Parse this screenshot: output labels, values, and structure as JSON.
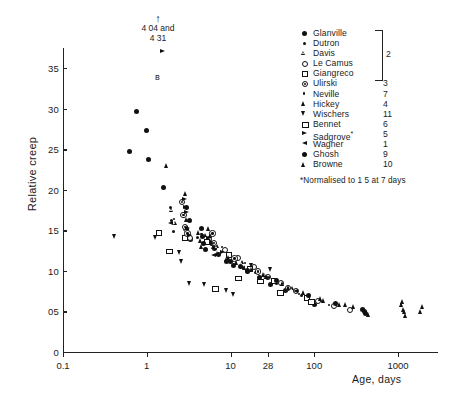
{
  "chart_data": {
    "type": "scatter",
    "title": "",
    "xlabel": "Age, days",
    "ylabel": "Relative creep",
    "xscale": "log",
    "xlim": [
      0.1,
      3000
    ],
    "ylim": [
      0,
      3.75
    ],
    "grid": false,
    "legend_position": "top-right",
    "xticks": [
      "0.1",
      "1",
      "10",
      "28",
      "100",
      "1000"
    ],
    "xtick_values": [
      0.1,
      1,
      10,
      28,
      100,
      1000
    ],
    "yticks": [
      "0",
      "05",
      "10",
      "15",
      "20",
      "25",
      "30",
      "35"
    ],
    "ytick_values": [
      0,
      0.5,
      1.0,
      1.5,
      2.0,
      2.5,
      3.0,
      3.5
    ],
    "annotations": [
      {
        "text_line1": "4 04 and",
        "text_line2": "4 31",
        "arrow": "↑"
      },
      {
        "text": "*Normalised to 1 5 at 7 days"
      }
    ],
    "series": [
      {
        "name": "Glanville",
        "ref": "2",
        "marker": "filled-circle",
        "points": [
          [
            0.75,
            2.97
          ],
          [
            1.0,
            2.73
          ],
          [
            0.62,
            2.47
          ],
          [
            1.05,
            2.37
          ],
          [
            1.6,
            2.03
          ],
          [
            3.0,
            1.78
          ],
          [
            3.2,
            1.62
          ],
          [
            3.1,
            1.43
          ],
          [
            3.3,
            1.39
          ],
          [
            6.5,
            1.28
          ],
          [
            7.2,
            1.2
          ],
          [
            9.0,
            1.12
          ],
          [
            13,
            1.05
          ],
          [
            16,
            0.99
          ],
          [
            22,
            0.92
          ],
          [
            30,
            0.83
          ],
          [
            45,
            0.76
          ],
          [
            90,
            0.62
          ],
          [
            100,
            0.58
          ]
        ]
      },
      {
        "name": "Dutron",
        "ref": "2",
        "marker": "small-dot",
        "points": [
          [
            1.9,
            1.78
          ],
          [
            2.0,
            1.62
          ],
          [
            2.1,
            1.49
          ],
          [
            4.0,
            1.41
          ],
          [
            6.0,
            1.33
          ],
          [
            11,
            1.14
          ],
          [
            20,
            0.98
          ],
          [
            35,
            0.84
          ],
          [
            70,
            0.7
          ]
        ]
      },
      {
        "name": "Davis",
        "ref": "2",
        "marker": "open-tri",
        "points": [
          [
            2.0,
            1.75
          ],
          [
            2.2,
            1.59
          ],
          [
            3.1,
            1.52
          ],
          [
            5.0,
            1.44
          ],
          [
            7.0,
            1.3
          ],
          [
            14,
            1.1
          ],
          [
            26,
            0.95
          ],
          [
            55,
            0.78
          ],
          [
            120,
            0.64
          ]
        ]
      },
      {
        "name": "Le Camus",
        "ref": "2",
        "marker": "open-circle",
        "points": [
          [
            2.9,
            1.52
          ],
          [
            3.2,
            1.41
          ],
          [
            5.5,
            1.4
          ],
          [
            8.5,
            1.26
          ],
          [
            12,
            1.17
          ],
          [
            19,
            1.05
          ],
          [
            28,
            0.93
          ],
          [
            40,
            0.86
          ],
          [
            60,
            0.76
          ],
          [
            110,
            0.63
          ],
          [
            170,
            0.57
          ],
          [
            260,
            0.52
          ]
        ]
      },
      {
        "name": "Giangreco",
        "ref": "2",
        "marker": "open-square",
        "points": [
          [
            1.4,
            1.47
          ],
          [
            2.8,
            1.41
          ],
          [
            5.2,
            1.36
          ],
          [
            9.5,
            1.2
          ],
          [
            17,
            1.03
          ],
          [
            33,
            0.88
          ],
          [
            80,
            0.67
          ]
        ]
      },
      {
        "name": "Ulirski",
        "ref": "3",
        "marker": "circle-dot",
        "points": [
          [
            2.6,
            1.86
          ],
          [
            2.7,
            1.7
          ],
          [
            2.8,
            1.55
          ],
          [
            3.0,
            1.47
          ],
          [
            6.0,
            1.47
          ],
          [
            6.2,
            1.35
          ],
          [
            11,
            1.16
          ],
          [
            21,
            1.0
          ],
          [
            48,
            0.8
          ]
        ]
      },
      {
        "name": "Neville",
        "ref": "7",
        "marker": "tiny-dot",
        "points": [
          [
            2.1,
            1.64
          ],
          [
            4.5,
            1.46
          ],
          [
            8.0,
            1.3
          ],
          [
            15,
            1.1
          ],
          [
            29,
            0.92
          ],
          [
            65,
            0.72
          ],
          [
            150,
            0.58
          ]
        ]
      },
      {
        "name": "Hickey",
        "ref": "4",
        "marker": "filled-tri",
        "points": [
          [
            1.75,
            2.3
          ],
          [
            2.9,
            1.96
          ],
          [
            3.0,
            1.64
          ],
          [
            3.1,
            1.54
          ],
          [
            5.5,
            1.52
          ],
          [
            5.8,
            1.44
          ],
          [
            6.0,
            1.36
          ],
          [
            6.3,
            1.3
          ],
          [
            7.0,
            1.22
          ],
          [
            9.5,
            1.16
          ],
          [
            12,
            1.1
          ],
          [
            18,
            1.02
          ],
          [
            27,
            0.93
          ],
          [
            42,
            0.84
          ],
          [
            75,
            0.73
          ],
          [
            130,
            0.64
          ],
          [
            200,
            0.58
          ],
          [
            300,
            0.56
          ],
          [
            400,
            0.53
          ],
          [
            420,
            0.49
          ],
          [
            450,
            0.46
          ],
          [
            1100,
            0.58
          ],
          [
            1200,
            0.5
          ],
          [
            1250,
            0.45
          ],
          [
            2000,
            0.56
          ]
        ]
      },
      {
        "name": "Wischers",
        "ref": "11",
        "marker": "down-tri",
        "points": [
          [
            0.42,
            1.42
          ],
          [
            1.3,
            1.41
          ],
          [
            2.5,
            1.23
          ],
          [
            2.6,
            1.12
          ],
          [
            3.3,
            0.84
          ],
          [
            5.0,
            0.83
          ],
          [
            9.0,
            0.76
          ],
          [
            11,
            0.71
          ],
          [
            18,
            1.07
          ],
          [
            30,
            1.02
          ]
        ]
      },
      {
        "name": "Bennet",
        "ref": "6",
        "marker": "open-rect",
        "points": [
          [
            1.8,
            1.25
          ],
          [
            6.5,
            0.79
          ],
          [
            12,
            0.92
          ],
          [
            22,
            0.88
          ],
          [
            38,
            0.74
          ],
          [
            90,
            0.63
          ]
        ]
      },
      {
        "name": "Sadgrove",
        "ref": "5",
        "marker": "right-tri",
        "points": [
          [
            2.8,
            1.88
          ],
          [
            2.9,
            1.78
          ],
          [
            3.0,
            1.72
          ],
          [
            3.1,
            1.52
          ],
          [
            3.2,
            1.43
          ],
          [
            5.5,
            1.4
          ],
          [
            6.0,
            1.33
          ],
          [
            8.0,
            1.22
          ]
        ]
      },
      {
        "name": "Wagner",
        "ref": "1",
        "marker": "left-tri",
        "points": [
          [
            1.9,
            1.58
          ],
          [
            6.3,
            1.19
          ],
          [
            14,
            1.03
          ],
          [
            26,
            0.9
          ],
          [
            60,
            0.74
          ]
        ]
      },
      {
        "name": "Ghosh",
        "ref": "9",
        "marker": "filled-circle",
        "points": [
          [
            4.5,
            1.52
          ],
          [
            4.6,
            1.42
          ],
          [
            4.8,
            1.34
          ],
          [
            5.0,
            1.26
          ],
          [
            10,
            1.12
          ],
          [
            11,
            1.07
          ],
          [
            16,
            1.01
          ],
          [
            35,
            0.88
          ],
          [
            85,
            0.7
          ],
          [
            180,
            0.6
          ],
          [
            380,
            0.52
          ],
          [
            400,
            0.5
          ],
          [
            410,
            0.47
          ]
        ]
      },
      {
        "name": "Browne",
        "ref": "10",
        "marker": "filled-tri",
        "points": [
          [
            4.2,
            1.48
          ],
          [
            4.4,
            1.38
          ],
          [
            4.5,
            1.3
          ],
          [
            9.0,
            1.14
          ],
          [
            15,
            1.04
          ],
          [
            25,
            0.96
          ],
          [
            50,
            0.8
          ],
          [
            120,
            0.66
          ],
          [
            240,
            0.58
          ],
          [
            1150,
            0.62
          ],
          [
            1180,
            0.53
          ],
          [
            1900,
            0.5
          ]
        ]
      }
    ]
  },
  "legend": {
    "bracket_ref": "2",
    "footnote": "*Normalised to 1 5 at 7 days"
  }
}
